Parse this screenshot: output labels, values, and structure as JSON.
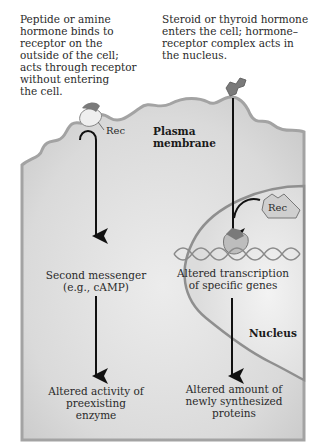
{
  "diagram": {
    "type": "hormone signaling pathways",
    "left_pathway": {
      "description": [
        "Peptide or amine",
        "hormone binds to",
        "receptor on the",
        "outside of the cell;",
        "acts through receptor",
        "without entering",
        "the cell."
      ],
      "receptor_label": "Rec",
      "intermediate": [
        "Second messenger",
        "(e.g., cAMP)"
      ],
      "outcome": [
        "Altered activity of",
        "preexisting",
        "enzyme"
      ]
    },
    "right_pathway": {
      "description": [
        "Steroid or thyroid hormone",
        "enters the cell; hormone–",
        "receptor complex acts in",
        "the nucleus."
      ],
      "receptor_label": "Rec",
      "intermediate": [
        "Altered transcription",
        "of specific genes"
      ],
      "outcome": [
        "Altered amount of",
        "newly synthesized",
        "proteins"
      ]
    },
    "labels": {
      "plasma_membrane": [
        "Plasma",
        "membrane"
      ],
      "nucleus": "Nucleus"
    },
    "colors": {
      "cytoplasm": "#dcdcdc",
      "membrane": "#9a9a9a",
      "nucleus_fill": "#e6e6e6",
      "arrow": "#111111"
    }
  }
}
